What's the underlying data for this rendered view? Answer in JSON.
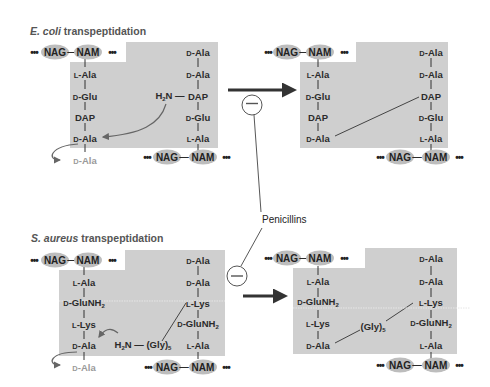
{
  "panels": {
    "ecoli": {
      "title_italic": "E. coli",
      "title_rest": " transpeptidation",
      "before": {
        "top_strand": {
          "left_dots": "•••",
          "nag": "NAG",
          "bond": "—",
          "nam": "NAM",
          "right_dots": "•••"
        },
        "left_chain": [
          {
            "prefix": "L",
            "name": "-Ala"
          },
          {
            "prefix": "D",
            "name": "-Glu"
          },
          {
            "prefix": "",
            "name": "DAP"
          },
          {
            "prefix": "D",
            "name": "-Ala"
          }
        ],
        "leaving_group": {
          "prefix": "D",
          "name": "-Ala"
        },
        "right_chain": [
          {
            "prefix": "D",
            "name": "-Ala"
          },
          {
            "prefix": "D",
            "name": "-Ala"
          },
          {
            "prefix": "",
            "name": "DAP"
          },
          {
            "prefix": "D",
            "name": "-Glu"
          },
          {
            "prefix": "L",
            "name": "-Ala"
          }
        ],
        "amine": {
          "h": "H",
          "sub": "2",
          "n": "N",
          "bond": "—"
        },
        "bottom_strand": {
          "left_dots": "•••",
          "nag": "NAG",
          "bond": "—",
          "nam": "NAM",
          "right_dots": "•••"
        }
      },
      "after": {
        "top_strand": {
          "left_dots": "•••",
          "nag": "NAG",
          "bond": "—",
          "nam": "NAM",
          "right_dots": "•••"
        },
        "left_chain": [
          {
            "prefix": "L",
            "name": "-Ala"
          },
          {
            "prefix": "D",
            "name": "-Glu"
          },
          {
            "prefix": "",
            "name": "DAP"
          },
          {
            "prefix": "D",
            "name": "-Ala"
          }
        ],
        "right_chain": [
          {
            "prefix": "D",
            "name": "-Ala"
          },
          {
            "prefix": "D",
            "name": "-Ala"
          },
          {
            "prefix": "",
            "name": "DAP"
          },
          {
            "prefix": "D",
            "name": "-Glu"
          },
          {
            "prefix": "L",
            "name": "-Ala"
          }
        ],
        "bottom_strand": {
          "left_dots": "•••",
          "nag": "NAG",
          "bond": "—",
          "nam": "NAM",
          "right_dots": "•••"
        }
      }
    },
    "saureus": {
      "title_italic": "S. aureus",
      "title_rest": " transpeptidation",
      "before": {
        "top_strand": {
          "left_dots": "•••",
          "nag": "NAG",
          "bond": "—",
          "nam": "NAM",
          "right_dots": "•••"
        },
        "left_chain": [
          {
            "prefix": "L",
            "name": "-Ala"
          },
          {
            "prefix": "D",
            "name": "-GluNH",
            "sub": "2"
          },
          {
            "prefix": "L",
            "name": "-Lys"
          },
          {
            "prefix": "D",
            "name": "-Ala"
          }
        ],
        "leaving_group": {
          "prefix": "D",
          "name": "-Ala"
        },
        "right_chain": [
          {
            "prefix": "D",
            "name": "-Ala"
          },
          {
            "prefix": "D",
            "name": "-Ala"
          },
          {
            "prefix": "L",
            "name": "-Lys"
          },
          {
            "prefix": "D",
            "name": "-GluNH",
            "sub": "2"
          },
          {
            "prefix": "L",
            "name": "-Ala"
          }
        ],
        "amine": {
          "h": "H",
          "sub": "2",
          "n": "N",
          "bond": "—",
          "gly": "(Gly)",
          "gly_sub": "5"
        },
        "bottom_strand": {
          "left_dots": "•••",
          "nag": "NAG",
          "bond": "—",
          "nam": "NAM",
          "right_dots": "•••"
        }
      },
      "after": {
        "top_strand": {
          "left_dots": "•••",
          "nag": "NAG",
          "bond": "—",
          "nam": "NAM",
          "right_dots": "•••"
        },
        "left_chain": [
          {
            "prefix": "L",
            "name": "-Ala"
          },
          {
            "prefix": "D",
            "name": "-GluNH",
            "sub": "2"
          },
          {
            "prefix": "L",
            "name": "-Lys"
          },
          {
            "prefix": "D",
            "name": "-Ala"
          }
        ],
        "bridge": {
          "gly": "(Gly)",
          "gly_sub": "5"
        },
        "right_chain": [
          {
            "prefix": "D",
            "name": "-Ala"
          },
          {
            "prefix": "D",
            "name": "-Ala"
          },
          {
            "prefix": "L",
            "name": "-Lys"
          },
          {
            "prefix": "D",
            "name": "-GluNH",
            "sub": "2"
          },
          {
            "prefix": "L",
            "name": "-Ala"
          }
        ],
        "bottom_strand": {
          "left_dots": "•••",
          "nag": "NAG",
          "bond": "—",
          "nam": "NAM",
          "right_dots": "•••"
        }
      }
    }
  },
  "inhibitor": {
    "label": "Penicillins",
    "symbol": "−"
  },
  "colors": {
    "box_fill": "#cfcfcf",
    "sugar_fill": "#bdbdbd",
    "text": "#2b2b2b",
    "leaving_text": "#9a9a9a",
    "arrow": "#333333"
  }
}
